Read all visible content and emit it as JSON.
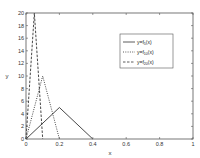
{
  "chart_data": {
    "type": "line",
    "title": "",
    "xlabel": "x",
    "ylabel": "y",
    "xlim": [
      0,
      1
    ],
    "ylim": [
      0,
      20
    ],
    "xticks": [
      "0",
      "0.2",
      "0.4",
      "0.6",
      "0.8",
      "1"
    ],
    "yticks": [
      "0",
      "2",
      "4",
      "6",
      "8",
      "10",
      "12",
      "14",
      "16",
      "18",
      "20"
    ],
    "grid": false,
    "legend_position": "upper right (inside)",
    "series": [
      {
        "name": "y=f_5(x)",
        "style": "solid",
        "x": [
          0,
          0.2,
          0.4
        ],
        "y": [
          0,
          5,
          0
        ]
      },
      {
        "name": "y=f_10(x)",
        "style": "dotted",
        "x": [
          0,
          0.1,
          0.2
        ],
        "y": [
          0,
          10,
          0
        ]
      },
      {
        "name": "y=f_20(x)",
        "style": "dashed",
        "x": [
          0,
          0.05,
          0.1
        ],
        "y": [
          0,
          20,
          0
        ]
      }
    ]
  },
  "labels": {
    "x": "x",
    "y": "y"
  },
  "legend": [
    {
      "prefix": "y=f",
      "sub": "5",
      "suffix": "(x)"
    },
    {
      "prefix": "y=f",
      "sub": "10",
      "suffix": "(x)"
    },
    {
      "prefix": "y=f",
      "sub": "20",
      "suffix": "(x)"
    }
  ]
}
